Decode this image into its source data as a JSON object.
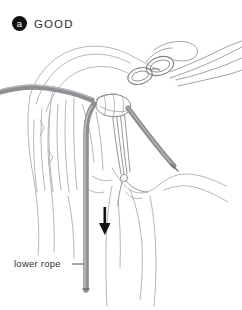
{
  "figure": {
    "background_color": "#ffffff",
    "line_color": "#9a9aa0",
    "rope_color": "#8e8e93",
    "accent_color": "#111111",
    "width": 242,
    "height": 310
  },
  "badge": {
    "letter": "a",
    "label": "GOOD",
    "circle_color": "#111111",
    "text_color": "#ffffff"
  },
  "callouts": [
    {
      "id": "lower-rope",
      "text": "lower rope",
      "leader": "— line to vertical rope"
    }
  ],
  "annotations": {
    "direction_arrow": {
      "name": "down-arrow",
      "direction": "down",
      "color": "#111111"
    }
  },
  "scene": {
    "title": "Rappel anchor — correct rope threading",
    "elements": [
      "rock-ledge",
      "rappel-rings",
      "anchor-cord",
      "upper-rope",
      "lower-rope",
      "rope-tail"
    ]
  }
}
